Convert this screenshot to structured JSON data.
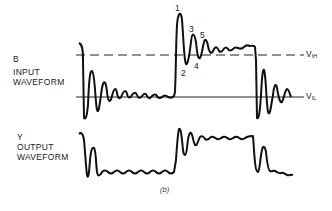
{
  "diagram": {
    "input": {
      "signal_label": "B",
      "title_line1": "INPUT",
      "title_line2": "WAVEFORM"
    },
    "output": {
      "signal_label": "Y",
      "title_line1": "OUTPUT",
      "title_line2": "WAVEFORM"
    },
    "thresholds": {
      "vih_main": "V",
      "vih_sub": "IH",
      "vil_main": "V",
      "vil_sub": "IL"
    },
    "ringing_points": [
      "1",
      "2",
      "3",
      "4",
      "5"
    ],
    "caption": "(b)",
    "colors": {
      "line": "#111111",
      "background": "#ffffff"
    }
  }
}
